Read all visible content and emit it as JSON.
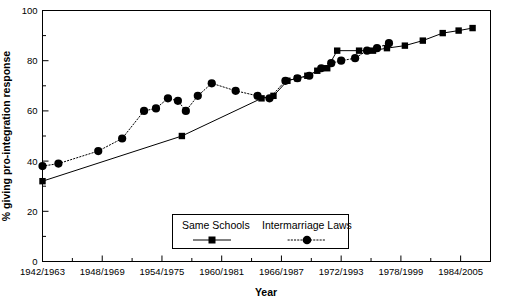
{
  "chart_data": {
    "type": "line",
    "title": "",
    "xlabel": "Year",
    "ylabel": "% giving pro-integration response",
    "ylim": [
      0,
      100
    ],
    "yticks": [
      0,
      20,
      40,
      60,
      80,
      100
    ],
    "ytick_labels": [
      "0",
      "20",
      "40",
      "60",
      "80",
      "100"
    ],
    "y_minor_ticks": [
      10,
      30,
      50,
      70,
      90
    ],
    "xlim": [
      1942,
      1987
    ],
    "xtick_labels": [
      "1942/1963",
      "1948/1969",
      "1954/1975",
      "1960/1981",
      "1966/1987",
      "1972/1993",
      "1978/1999",
      "1984/2005"
    ],
    "xtick_values": [
      1942,
      1948,
      1954,
      1960,
      1966,
      1972,
      1978,
      1984
    ],
    "x_minor_tick_values": [
      1945,
      1951,
      1957,
      1963,
      1969,
      1975,
      1981,
      1987
    ],
    "grid": false,
    "legend_position": "bottom-center",
    "series": [
      {
        "name": "Same Schools",
        "marker": "square",
        "linestyle": "solid",
        "color": "#000000",
        "points": [
          {
            "x": 1942,
            "y": 32
          },
          {
            "x": 1956,
            "y": 50
          },
          {
            "x": 1964,
            "y": 65
          },
          {
            "x": 1965.2,
            "y": 66
          },
          {
            "x": 1966.6,
            "y": 72
          },
          {
            "x": 1967.6,
            "y": 73
          },
          {
            "x": 1968.6,
            "y": 74
          },
          {
            "x": 1969.6,
            "y": 76
          },
          {
            "x": 1970.6,
            "y": 77
          },
          {
            "x": 1971.6,
            "y": 84
          },
          {
            "x": 1973.8,
            "y": 84
          },
          {
            "x": 1975.2,
            "y": 84
          },
          {
            "x": 1976.6,
            "y": 85
          },
          {
            "x": 1978.4,
            "y": 86
          },
          {
            "x": 1980.2,
            "y": 88
          },
          {
            "x": 1982.2,
            "y": 91
          },
          {
            "x": 1983.8,
            "y": 92
          },
          {
            "x": 1985.2,
            "y": 93
          }
        ]
      },
      {
        "name": "Intermarriage Laws",
        "marker": "circle",
        "linestyle": "dotted",
        "color": "#000000",
        "points": [
          {
            "x": 1942,
            "y": 38
          },
          {
            "x": 1943.6,
            "y": 39
          },
          {
            "x": 1947.6,
            "y": 44
          },
          {
            "x": 1950,
            "y": 49
          },
          {
            "x": 1952.2,
            "y": 60
          },
          {
            "x": 1953.4,
            "y": 61
          },
          {
            "x": 1954.6,
            "y": 65
          },
          {
            "x": 1955.6,
            "y": 64
          },
          {
            "x": 1956.4,
            "y": 60
          },
          {
            "x": 1957.6,
            "y": 66
          },
          {
            "x": 1959,
            "y": 71
          },
          {
            "x": 1961.4,
            "y": 68
          },
          {
            "x": 1963.6,
            "y": 66
          },
          {
            "x": 1964.8,
            "y": 65
          },
          {
            "x": 1966.4,
            "y": 72
          },
          {
            "x": 1967.6,
            "y": 73
          },
          {
            "x": 1968.8,
            "y": 74
          },
          {
            "x": 1970,
            "y": 77
          },
          {
            "x": 1971,
            "y": 79
          },
          {
            "x": 1972,
            "y": 80
          },
          {
            "x": 1973.4,
            "y": 81
          },
          {
            "x": 1974.6,
            "y": 84
          },
          {
            "x": 1975.6,
            "y": 85
          },
          {
            "x": 1976.8,
            "y": 87
          }
        ]
      }
    ]
  },
  "legend": {
    "items": [
      {
        "label": "Same Schools",
        "marker": "square",
        "linestyle": "solid"
      },
      {
        "label": "Intermarriage Laws",
        "marker": "circle",
        "linestyle": "dotted"
      }
    ]
  }
}
